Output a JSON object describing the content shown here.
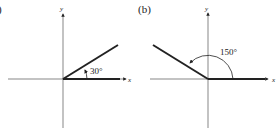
{
  "figure": {
    "panels": [
      {
        "label": "(a)",
        "visible_label": ")",
        "angle_label": "30°",
        "angle_degrees": 30,
        "x_axis_label": "x",
        "y_axis_label": "y",
        "rotation": "counterclockwise"
      },
      {
        "label": "(b)",
        "visible_label": "(b)",
        "angle_label": "150°",
        "angle_degrees": 150,
        "x_axis_label": "x",
        "y_axis_label": "y",
        "rotation": "counterclockwise"
      }
    ],
    "colors": {
      "line": "#222222",
      "background": "#ffffff"
    }
  }
}
